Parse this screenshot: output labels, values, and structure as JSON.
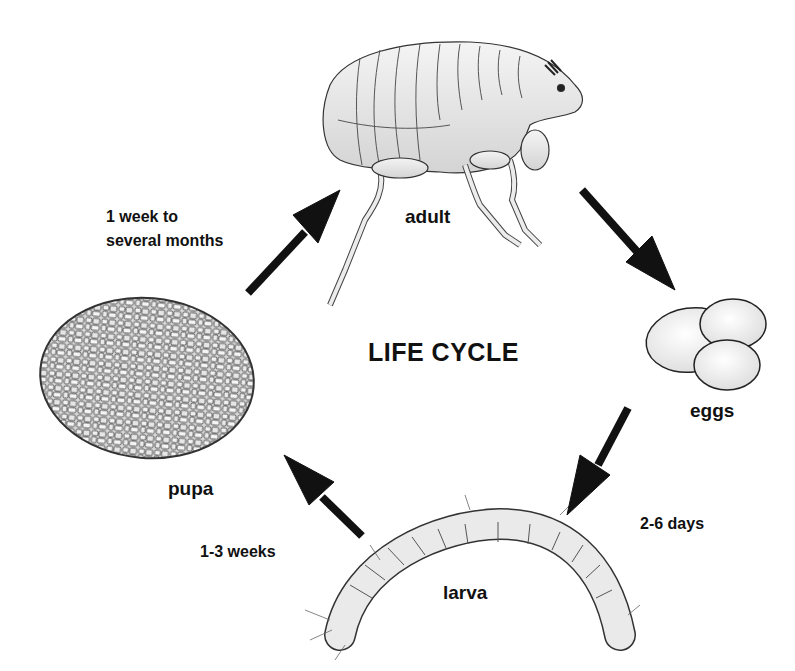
{
  "diagram": {
    "title": "LIFE CYCLE",
    "stages": [
      {
        "id": "adult",
        "label": "adult"
      },
      {
        "id": "eggs",
        "label": "eggs"
      },
      {
        "id": "larva",
        "label": "larva"
      },
      {
        "id": "pupa",
        "label": "pupa"
      }
    ],
    "transitions": [
      {
        "from": "pupa",
        "to": "adult",
        "duration_line1": "1 week to",
        "duration_line2": "several months"
      },
      {
        "from": "adult",
        "to": "eggs",
        "duration_line1": ""
      },
      {
        "from": "eggs",
        "to": "larva",
        "duration_line1": "2-6 days"
      },
      {
        "from": "larva",
        "to": "pupa",
        "duration_line1": "1-3 weeks"
      }
    ],
    "colors": {
      "background": "#ffffff",
      "ink": "#111111",
      "illustration_fill": "#e9e9e9",
      "illustration_stroke": "#3a3a3a"
    }
  }
}
